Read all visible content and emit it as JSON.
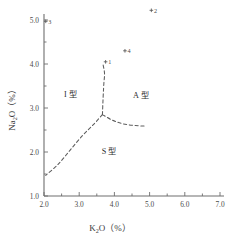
{
  "chart_data": {
    "type": "scatter",
    "title": "",
    "xlabel": "K₂O（%）",
    "ylabel": "Na₂O（%）",
    "xlabel_main": "K",
    "xlabel_sub": "2",
    "xlabel_rest": "O（%）",
    "ylabel_main": "Na",
    "ylabel_sub": "2",
    "ylabel_rest": "O（%）",
    "xlim": [
      2.0,
      7.0
    ],
    "ylim": [
      1.0,
      5.0
    ],
    "xticks": [
      2.0,
      3.0,
      4.0,
      5.0,
      6.0,
      7.0
    ],
    "xtick_labels": [
      "2.0",
      "3.0",
      "4.0",
      "5.0",
      "6.0",
      "7.0"
    ],
    "x_minor_ticks": [
      2.5,
      3.5,
      4.5,
      5.5,
      6.5
    ],
    "yticks": [
      1.0,
      2.0,
      3.0,
      4.0,
      5.0
    ],
    "ytick_labels": [
      "1.0",
      "2.0",
      "3.0",
      "4.0",
      "5.0"
    ],
    "y_minor_ticks": [
      1.5,
      2.5,
      3.5,
      4.5
    ],
    "grid": false,
    "legend": "none",
    "points": [
      {
        "label": "1",
        "x": 3.75,
        "y": 4.05
      },
      {
        "label": "2",
        "x": 5.05,
        "y": 5.22
      },
      {
        "label": "3",
        "x": 2.05,
        "y": 4.97
      },
      {
        "label": "4",
        "x": 4.3,
        "y": 4.3
      }
    ],
    "fields": [
      {
        "label": "I 型",
        "x": 2.75,
        "y": 3.25
      },
      {
        "label": "A 型",
        "x": 4.75,
        "y": 3.22
      },
      {
        "label": "S 型",
        "x": 3.85,
        "y": 1.95
      }
    ],
    "boundaries": [
      {
        "name": "I-A-upper-branch",
        "comment": "upper near-vertical dashed curve from triple junction to point 1 area",
        "path": [
          [
            3.66,
            2.85
          ],
          [
            3.68,
            3.25
          ],
          [
            3.7,
            3.55
          ],
          [
            3.72,
            3.78
          ],
          [
            3.68,
            3.98
          ]
        ]
      },
      {
        "name": "I-S-lower-left-branch",
        "comment": "dashed curve from triple junction down-left to left axis",
        "path": [
          [
            3.66,
            2.85
          ],
          [
            3.4,
            2.62
          ],
          [
            3.1,
            2.38
          ],
          [
            2.75,
            2.05
          ],
          [
            2.4,
            1.72
          ],
          [
            2.05,
            1.47
          ]
        ]
      },
      {
        "name": "A-S-right-branch",
        "comment": "dashed curve from triple junction curving right and flattening",
        "path": [
          [
            3.66,
            2.85
          ],
          [
            3.95,
            2.72
          ],
          [
            4.25,
            2.64
          ],
          [
            4.6,
            2.6
          ],
          [
            4.9,
            2.59
          ]
        ]
      }
    ]
  }
}
